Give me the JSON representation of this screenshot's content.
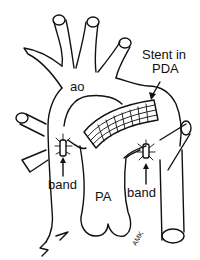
{
  "diagram": {
    "type": "anatomical-line-drawing",
    "colors": {
      "line": "#111111",
      "background": "#ffffff"
    },
    "labels": {
      "aorta": "ao",
      "stent_line1": "Stent in",
      "stent_line2": "PDA",
      "band_left": "band",
      "band_right": "band",
      "pulmonary_artery": "PA",
      "signature": "AMK"
    },
    "arrows": [
      {
        "from": "stent-label",
        "to": "ductal-stent"
      },
      {
        "from": "band-left-label",
        "to": "left-pa-band"
      },
      {
        "from": "band-right-label",
        "to": "right-pa-band"
      }
    ]
  }
}
